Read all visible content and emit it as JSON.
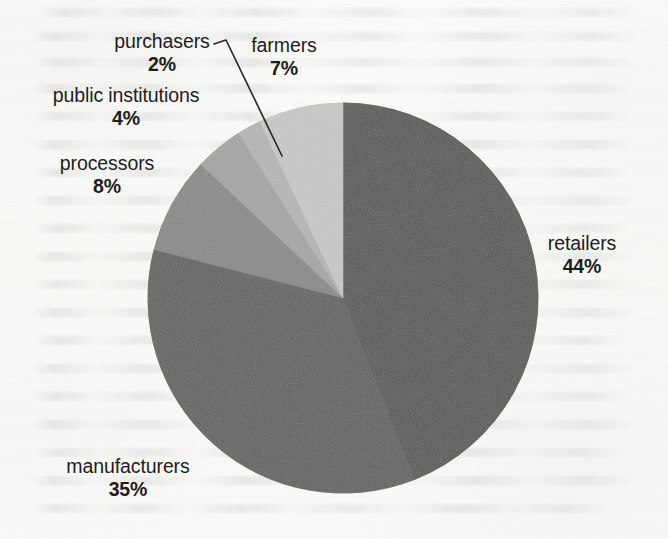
{
  "chart_data": {
    "type": "pie",
    "title": "",
    "subtitle": "",
    "xlabel": "",
    "ylabel": "",
    "legend_position": "labels-outside",
    "grid": false,
    "units": "percent",
    "total": 100,
    "start_angle_deg": 0,
    "direction": "clockwise",
    "categories": [
      "retailers",
      "manufacturers",
      "processors",
      "public institutions",
      "purchasers",
      "farmers"
    ],
    "values": [
      44,
      35,
      8,
      4,
      2,
      7
    ],
    "labels": [
      "44%",
      "35%",
      "8%",
      "4%",
      "2%",
      "7%"
    ],
    "colors": [
      "#5b5b5b",
      "#646464",
      "#8b8b8b",
      "#a6a6a6",
      "#b6b6b6",
      "#c9c9c9"
    ],
    "slices": [
      {
        "name": "retailers",
        "value": 44,
        "label": "44%",
        "color": "#5b5b5b"
      },
      {
        "name": "manufacturers",
        "value": 35,
        "label": "35%",
        "color": "#646464"
      },
      {
        "name": "processors",
        "value": 8,
        "label": "8%",
        "color": "#8b8b8b"
      },
      {
        "name": "public institutions",
        "value": 4,
        "label": "4%",
        "color": "#a6a6a6"
      },
      {
        "name": "purchasers",
        "value": 2,
        "label": "2%",
        "color": "#b6b6b6"
      },
      {
        "name": "farmers",
        "value": 7,
        "label": "7%",
        "color": "#c9c9c9"
      }
    ]
  },
  "labels": {
    "purchasers": {
      "name": "purchasers",
      "pct": "2%"
    },
    "farmers": {
      "name": "farmers",
      "pct": "7%"
    },
    "public_institutions": {
      "name": "public institutions",
      "pct": "4%"
    },
    "processors": {
      "name": "processors",
      "pct": "8%"
    },
    "retailers": {
      "name": "retailers",
      "pct": "44%"
    },
    "manufacturers": {
      "name": "manufacturers",
      "pct": "35%"
    }
  },
  "geometry": {
    "center_x": 343,
    "center_y": 298,
    "radius": 195
  }
}
